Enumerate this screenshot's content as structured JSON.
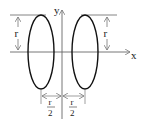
{
  "diagram": {
    "axes": {
      "x_label": "x",
      "y_label": "y"
    },
    "dimensions": {
      "height_label_left": "r",
      "height_label_right": "r",
      "offset_left": {
        "numerator": "r",
        "denominator": "2"
      },
      "offset_right": {
        "numerator": "r",
        "denominator": "2"
      }
    },
    "colors": {
      "ellipse_stroke": "#111111",
      "axis_stroke": "#666666",
      "guide_stroke": "#777777",
      "label_color": "#222222"
    }
  }
}
